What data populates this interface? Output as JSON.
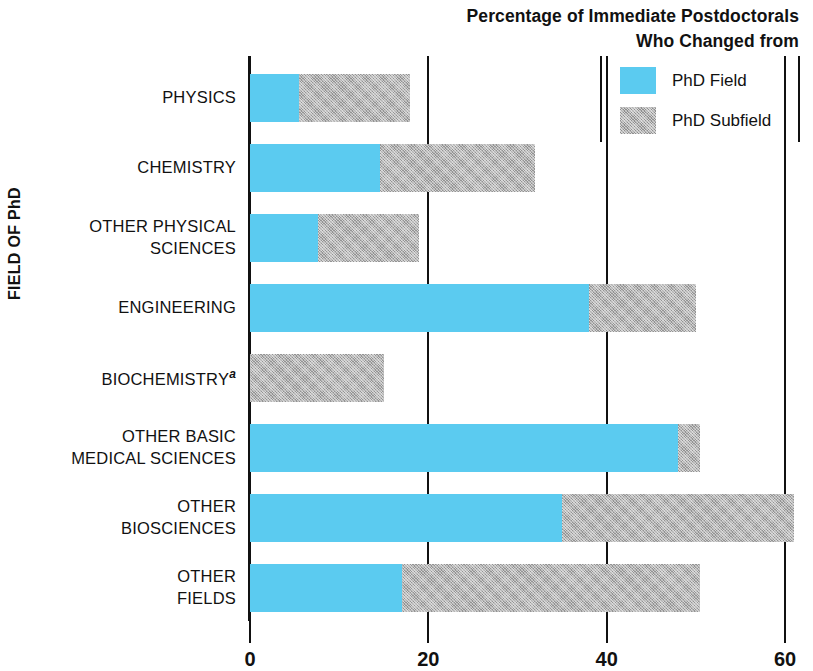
{
  "chart_data": {
    "type": "bar",
    "orientation": "horizontal",
    "stacked": true,
    "title": "Percentage of Immediate Postdoctorals Who Changed from",
    "title_lines": [
      "Percentage of Immediate Postdoctorals",
      "Who Changed from"
    ],
    "xlabel": "",
    "ylabel": "FIELD OF PhD",
    "xlim": [
      0,
      63
    ],
    "xticks": [
      0,
      20,
      40,
      60
    ],
    "xtick_labels": [
      "0",
      "20",
      "40",
      "60"
    ],
    "grid": "vertical gridlines at 20, 40, 60",
    "legend_position": "top-right",
    "footnote_marker": "a",
    "categories": [
      "PHYSICS",
      "CHEMISTRY",
      "OTHER PHYSICAL SCIENCES",
      "ENGINEERING",
      "BIOCHEMISTRY",
      "OTHER BASIC MEDICAL SCIENCES",
      "OTHER BIOSCIENCES",
      "OTHER FIELDS"
    ],
    "series": [
      {
        "name": "PhD Field",
        "color": "#5BCBF0",
        "values": [
          5.5,
          14.6,
          7.6,
          38.0,
          0.0,
          48.0,
          35.0,
          17.0
        ]
      },
      {
        "name": "PhD Subfield",
        "color": "#b4b4b4",
        "values": [
          12.5,
          17.4,
          11.4,
          12.0,
          15.0,
          2.5,
          26.0,
          33.5
        ]
      }
    ],
    "totals": [
      18.0,
      32.0,
      19.0,
      50.0,
      15.0,
      50.5,
      61.0,
      50.5
    ]
  },
  "legend": {
    "title_line_1": "Percentage of Immediate Postdoctorals",
    "title_line_2": "Who Changed from",
    "items": [
      {
        "label": "PhD Field",
        "swatch": "cyan"
      },
      {
        "label": "PhD Subfield",
        "swatch": "gray"
      }
    ]
  },
  "axes": {
    "y_title": "FIELD OF PhD",
    "x_tick_labels": [
      "0",
      "20",
      "40",
      "60"
    ]
  },
  "rows": [
    {
      "label_lines": [
        "PHYSICS"
      ],
      "superscript": ""
    },
    {
      "label_lines": [
        "CHEMISTRY"
      ],
      "superscript": ""
    },
    {
      "label_lines": [
        "OTHER PHYSICAL",
        "SCIENCES"
      ],
      "superscript": ""
    },
    {
      "label_lines": [
        "ENGINEERING"
      ],
      "superscript": ""
    },
    {
      "label_lines": [
        "BIOCHEMISTRY"
      ],
      "superscript": "a"
    },
    {
      "label_lines": [
        "OTHER BASIC",
        "MEDICAL SCIENCES"
      ],
      "superscript": ""
    },
    {
      "label_lines": [
        "OTHER",
        "BIOSCIENCES"
      ],
      "superscript": ""
    },
    {
      "label_lines": [
        "OTHER",
        "FIELDS"
      ],
      "superscript": ""
    }
  ],
  "colors": {
    "phd_field": "#5BCBF0",
    "phd_subfield": "#b4b4b4",
    "axis": "#111111",
    "background": "#ffffff"
  }
}
